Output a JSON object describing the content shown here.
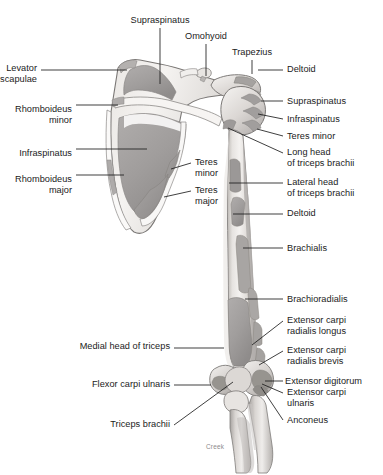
{
  "figure": {
    "signature": "Creek",
    "colors": {
      "ink": "#1b1b1b",
      "leader": "#1d1d1d",
      "bone_light": "#f2f0ee",
      "bone_mid": "#cfcbc7",
      "attachment_gray": "#a3a0a0",
      "attachment_dark": "#8d8a8a",
      "outline": "#6e6b6b",
      "signature": "#8b8b8b",
      "background": "#ffffff"
    }
  },
  "labels": {
    "top": [
      {
        "id": "supraspinatus-top",
        "text": "Supraspinatus",
        "x": 160,
        "y": 15,
        "align": "center"
      },
      {
        "id": "omohyoid",
        "text": "Omohyoid",
        "x": 206,
        "y": 31,
        "align": "center"
      },
      {
        "id": "trapezius",
        "text": "Trapezius",
        "x": 252,
        "y": 47,
        "align": "center"
      }
    ],
    "left": [
      {
        "id": "levator-scapulae",
        "text": "Levator\nscapulae",
        "x": 37,
        "y": 63,
        "align": "right"
      },
      {
        "id": "rhomboideus-minor",
        "text": "Rhomboideus\nminor",
        "x": 72,
        "y": 104,
        "align": "right"
      },
      {
        "id": "infraspinatus-left",
        "text": "Infraspinatus",
        "x": 72,
        "y": 148,
        "align": "right"
      },
      {
        "id": "rhomboideus-major",
        "text": "Rhomboideus\nmajor",
        "x": 72,
        "y": 174,
        "align": "right"
      },
      {
        "id": "medial-head-of-triceps",
        "text": "Medial head of triceps",
        "x": 170,
        "y": 341,
        "align": "right"
      },
      {
        "id": "flexor-carpi-ulnaris",
        "text": "Flexor carpi ulnaris",
        "x": 170,
        "y": 379,
        "align": "right"
      },
      {
        "id": "triceps-brachii",
        "text": "Triceps brachii",
        "x": 170,
        "y": 419,
        "align": "right"
      }
    ],
    "inner": [
      {
        "id": "teres-minor-inner",
        "text": "Teres\nminor",
        "x": 195,
        "y": 157,
        "align": "left"
      },
      {
        "id": "teres-major-inner",
        "text": "Teres\nmajor",
        "x": 195,
        "y": 185,
        "align": "left"
      }
    ],
    "right": [
      {
        "id": "deltoid-upper",
        "text": "Deltoid",
        "x": 287,
        "y": 64,
        "align": "left"
      },
      {
        "id": "supraspinatus-right",
        "text": "Supraspinatus",
        "x": 287,
        "y": 96,
        "align": "left"
      },
      {
        "id": "infraspinatus-right",
        "text": "Infraspinatus",
        "x": 287,
        "y": 114,
        "align": "left"
      },
      {
        "id": "teres-minor-right",
        "text": "Teres minor",
        "x": 287,
        "y": 131,
        "align": "left"
      },
      {
        "id": "long-head-of-triceps-brachii",
        "text": "Long head\nof triceps brachii",
        "x": 287,
        "y": 147,
        "align": "left"
      },
      {
        "id": "lateral-head-of-triceps-brachii",
        "text": "Lateral head\nof triceps brachii",
        "x": 287,
        "y": 177,
        "align": "left"
      },
      {
        "id": "deltoid-lower",
        "text": "Deltoid",
        "x": 287,
        "y": 208,
        "align": "left"
      },
      {
        "id": "brachialis",
        "text": "Brachialis",
        "x": 287,
        "y": 243,
        "align": "left"
      },
      {
        "id": "brachioradialis",
        "text": "Brachioradialis",
        "x": 287,
        "y": 294,
        "align": "left"
      },
      {
        "id": "extensor-carpi-radialis-longus",
        "text": "Extensor carpi\nradialis longus",
        "x": 287,
        "y": 315,
        "align": "left"
      },
      {
        "id": "extensor-carpi-radialis-brevis",
        "text": "Extensor carpi\nradialis brevis",
        "x": 287,
        "y": 345,
        "align": "left"
      },
      {
        "id": "extensor-digitorum",
        "text": "Extensor digitorum",
        "x": 285,
        "y": 376,
        "align": "left"
      },
      {
        "id": "extensor-carpi-ulnaris",
        "text": "Extensor carpi\nulnaris",
        "x": 287,
        "y": 387,
        "align": "left"
      },
      {
        "id": "anconeus",
        "text": "Anconeus",
        "x": 287,
        "y": 415,
        "align": "left"
      }
    ]
  },
  "leader_lines": [
    {
      "id": "leader-supraspinatus-top",
      "d": "M160,28 L160,84"
    },
    {
      "id": "leader-omohyoid",
      "d": "M206,44 L206,76"
    },
    {
      "id": "leader-trapezius",
      "d": "M252,60 L252,74"
    },
    {
      "id": "leader-levator-scapulae",
      "d": "M41,70 L127,70"
    },
    {
      "id": "leader-rhomboideus-minor",
      "d": "M76,105 L118,105"
    },
    {
      "id": "leader-infraspinatus-left",
      "d": "M76,149 L147,149"
    },
    {
      "id": "leader-rhomboideus-major",
      "d": "M76,175 L124,175"
    },
    {
      "id": "leader-teres-minor-inner",
      "d": "M191,163 L171,169"
    },
    {
      "id": "leader-teres-major-inner",
      "d": "M191,191 L164,197"
    },
    {
      "id": "leader-deltoid-upper",
      "d": "M283,70 L258,70"
    },
    {
      "id": "leader-supraspinatus-right",
      "d": "M283,101 L261,101"
    },
    {
      "id": "leader-infraspinatus-right",
      "d": "M283,119 L258,114"
    },
    {
      "id": "leader-teres-minor-right",
      "d": "M283,136 L257,129"
    },
    {
      "id": "leader-long-head",
      "d": "M283,153 L228,128"
    },
    {
      "id": "leader-lateral-head",
      "d": "M283,183 L229,183"
    },
    {
      "id": "leader-deltoid-lower",
      "d": "M283,214 L233,214"
    },
    {
      "id": "leader-brachialis",
      "d": "M283,248 L243,248"
    },
    {
      "id": "leader-brachioradialis",
      "d": "M283,299 L245,299"
    },
    {
      "id": "leader-ecrl",
      "d": "M283,321 L252,345"
    },
    {
      "id": "leader-ecrb",
      "d": "M283,351 L259,365"
    },
    {
      "id": "leader-ext-digitorum",
      "d": "M283,381 L265,381"
    },
    {
      "id": "leader-ecu",
      "d": "M283,393 L262,384"
    },
    {
      "id": "leader-anconeus",
      "d": "M283,420 L261,387"
    },
    {
      "id": "leader-medial-head",
      "d": "M174,348 L224,348"
    },
    {
      "id": "leader-flexor-carpi-ulnaris",
      "d": "M174,385 L211,385"
    },
    {
      "id": "leader-triceps-brachii",
      "d": "M174,425 L233,382"
    }
  ]
}
